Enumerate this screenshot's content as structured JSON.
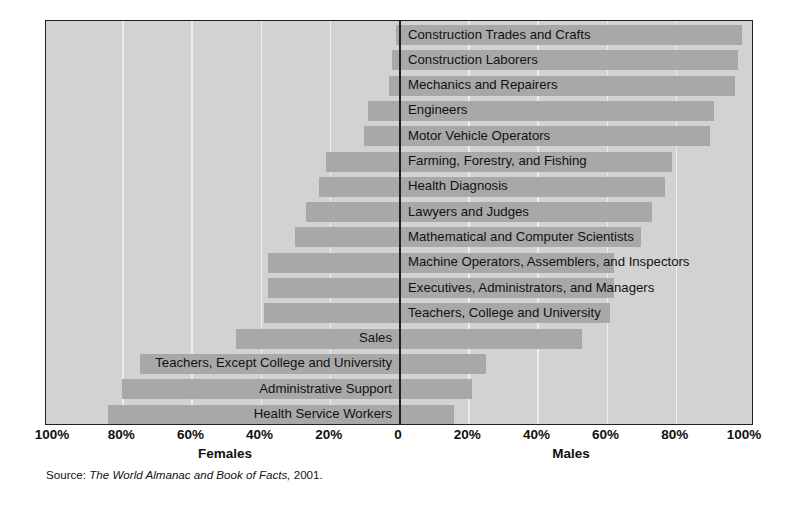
{
  "chart_data": {
    "type": "bar",
    "title": "",
    "subtitle": "",
    "orientation": "horizontal-diverging",
    "xlabel": "",
    "ylabel": "",
    "xlim": [
      -100,
      100
    ],
    "grid": true,
    "legend_position": "none",
    "axis_left_label": "Females",
    "axis_right_label": "Males",
    "tick_labels_left": [
      "100%",
      "80%",
      "60%",
      "40%",
      "20%"
    ],
    "tick_labels_center": "0",
    "tick_labels_right": [
      "20%",
      "40%",
      "60%",
      "80%",
      "100%"
    ],
    "tick_values": [
      -100,
      -80,
      -60,
      -40,
      -20,
      0,
      20,
      40,
      60,
      80,
      100
    ],
    "categories": [
      "Construction Trades and Crafts",
      "Construction Laborers",
      "Mechanics and Repairers",
      "Engineers",
      "Motor Vehicle Operators",
      "Farming, Forestry, and Fishing",
      "Health Diagnosis",
      "Lawyers and Judges",
      "Mathematical and Computer Scientists",
      "Machine Operators, Assemblers, and Inspectors",
      "Executives, Administrators, and Managers",
      "Teachers, College and University",
      "Sales",
      "Teachers, Except College and University",
      "Administrative Support",
      "Health Service Workers"
    ],
    "series": [
      {
        "name": "Males",
        "values": [
          99,
          98,
          97,
          91,
          90,
          79,
          77,
          73,
          70,
          62,
          62,
          61,
          53,
          25,
          21,
          16
        ]
      },
      {
        "name": "Females",
        "values": [
          1,
          2,
          3,
          9,
          10,
          21,
          23,
          27,
          30,
          38,
          38,
          39,
          47,
          75,
          80,
          84
        ]
      }
    ],
    "label_side": [
      "right",
      "right",
      "right",
      "right",
      "right",
      "right",
      "right",
      "right",
      "right",
      "right",
      "right",
      "right",
      "left",
      "left",
      "left",
      "left"
    ],
    "colors": {
      "bar": "#a8a8a8",
      "plot_background": "#d2d2d2",
      "gridline": "#ececec",
      "axis": "#231f20",
      "text": "#111111"
    }
  },
  "source": {
    "prefix": "Source:",
    "italic_part": "The World Almanac and Book of Facts,",
    "suffix": "2001."
  }
}
